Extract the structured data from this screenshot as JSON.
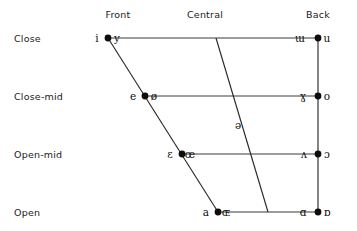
{
  "figure": {
    "background": "#ffffff",
    "ink": "#1a1a1a"
  },
  "columns": [
    {
      "key": "front",
      "label": "Front",
      "x": 118
    },
    {
      "key": "central",
      "label": "Central",
      "x": 205
    },
    {
      "key": "back",
      "label": "Back",
      "x": 318
    }
  ],
  "rows": [
    {
      "key": "close",
      "label": "Close",
      "y": 38
    },
    {
      "key": "close-mid",
      "label": "Close-mid",
      "y": 96
    },
    {
      "key": "open-mid",
      "label": "Open-mid",
      "y": 154
    },
    {
      "key": "open",
      "label": "Open",
      "y": 212
    }
  ],
  "edges": {
    "front_diagonal": {
      "x1": 108,
      "y1": 38,
      "x2": 218,
      "y2": 212
    },
    "back_vertical": {
      "x1": 318,
      "y1": 38,
      "x2": 318,
      "y2": 212
    },
    "central_diagonal": {
      "x1": 216,
      "y1": 38,
      "x2": 268,
      "y2": 212
    }
  },
  "horizontals": [
    {
      "row": "close",
      "x1": 108,
      "x2": 318,
      "y": 38
    },
    {
      "row": "close-mid",
      "x1": 145,
      "x2": 318,
      "y": 96
    },
    {
      "row": "open-mid",
      "x1": 182,
      "x2": 318,
      "y": 154
    },
    {
      "row": "open",
      "x1": 218,
      "x2": 318,
      "y": 212
    }
  ],
  "vowels": [
    {
      "row": "close",
      "column": "front",
      "dot": {
        "cx": 108,
        "cy": 38
      },
      "unrounded": {
        "symbol": "i",
        "name": "close-front-unrounded",
        "x": 97,
        "y": 42
      },
      "rounded": {
        "symbol": "y",
        "name": "close-front-rounded",
        "x": 117,
        "y": 42
      }
    },
    {
      "row": "close",
      "column": "back",
      "dot": {
        "cx": 318,
        "cy": 38
      },
      "unrounded": {
        "symbol": "ɯ",
        "name": "close-back-unrounded",
        "x": 300,
        "y": 42
      },
      "rounded": {
        "symbol": "u",
        "name": "close-back-rounded",
        "x": 327,
        "y": 42
      }
    },
    {
      "row": "close-mid",
      "column": "front",
      "dot": {
        "cx": 145,
        "cy": 96
      },
      "unrounded": {
        "symbol": "e",
        "name": "close-mid-front-unrounded",
        "x": 133,
        "y": 100
      },
      "rounded": {
        "symbol": "ø",
        "name": "close-mid-front-rounded",
        "x": 154,
        "y": 100
      }
    },
    {
      "row": "close-mid",
      "column": "back",
      "dot": {
        "cx": 318,
        "cy": 96
      },
      "unrounded": {
        "symbol": "ɣ",
        "name": "close-mid-back-unrounded",
        "x": 303,
        "y": 100
      },
      "rounded": {
        "symbol": "o",
        "name": "close-mid-back-rounded",
        "x": 327,
        "y": 100
      }
    },
    {
      "row": "open-mid",
      "column": "front",
      "dot": {
        "cx": 182,
        "cy": 154
      },
      "unrounded": {
        "symbol": "ɛ",
        "name": "open-mid-front-unrounded",
        "x": 170,
        "y": 158
      },
      "rounded": {
        "symbol": "œ",
        "name": "open-mid-front-rounded",
        "x": 190,
        "y": 158
      }
    },
    {
      "row": "open-mid",
      "column": "back",
      "dot": {
        "cx": 318,
        "cy": 154
      },
      "unrounded": {
        "symbol": "ʌ",
        "name": "open-mid-back-unrounded",
        "x": 304,
        "y": 158
      },
      "rounded": {
        "symbol": "ɔ",
        "name": "open-mid-back-rounded",
        "x": 327,
        "y": 158
      }
    },
    {
      "row": "open",
      "column": "front",
      "dot": {
        "cx": 218,
        "cy": 212
      },
      "unrounded": {
        "symbol": "a",
        "name": "open-front-unrounded",
        "x": 206,
        "y": 216
      },
      "rounded": {
        "symbol": "ɶ",
        "name": "open-front-rounded",
        "x": 226,
        "y": 216
      }
    },
    {
      "row": "open",
      "column": "back",
      "dot": {
        "cx": 318,
        "cy": 212
      },
      "unrounded": {
        "symbol": "ɑ",
        "name": "open-back-unrounded",
        "x": 303,
        "y": 216
      },
      "rounded": {
        "symbol": "ɒ",
        "name": "open-back-rounded",
        "x": 327,
        "y": 216
      }
    }
  ],
  "central_vowels": [
    {
      "symbol": "ə",
      "name": "mid-central-schwa",
      "x": 238,
      "y": 129
    }
  ],
  "row_label_x": 14,
  "chart_data": {
    "type": "scatter",
    "xlabel": "",
    "ylabel": "",
    "categories": [
      "Front",
      "Central",
      "Back"
    ],
    "tick_labels_y": [
      "Close",
      "Close-mid",
      "Open-mid",
      "Open"
    ],
    "grid": true,
    "legend": "none",
    "points": [
      {
        "symbol": "i",
        "height": "Close",
        "backness": "Front",
        "rounding": "unrounded"
      },
      {
        "symbol": "y",
        "height": "Close",
        "backness": "Front",
        "rounding": "rounded"
      },
      {
        "symbol": "ɯ",
        "height": "Close",
        "backness": "Back",
        "rounding": "unrounded"
      },
      {
        "symbol": "u",
        "height": "Close",
        "backness": "Back",
        "rounding": "rounded"
      },
      {
        "symbol": "e",
        "height": "Close-mid",
        "backness": "Front",
        "rounding": "unrounded"
      },
      {
        "symbol": "ø",
        "height": "Close-mid",
        "backness": "Front",
        "rounding": "rounded"
      },
      {
        "symbol": "ɣ",
        "height": "Close-mid",
        "backness": "Back",
        "rounding": "unrounded"
      },
      {
        "symbol": "o",
        "height": "Close-mid",
        "backness": "Back",
        "rounding": "rounded"
      },
      {
        "symbol": "ə",
        "height": "Mid",
        "backness": "Central",
        "rounding": "unspecified"
      },
      {
        "symbol": "ɛ",
        "height": "Open-mid",
        "backness": "Front",
        "rounding": "unrounded"
      },
      {
        "symbol": "œ",
        "height": "Open-mid",
        "backness": "Front",
        "rounding": "rounded"
      },
      {
        "symbol": "ʌ",
        "height": "Open-mid",
        "backness": "Back",
        "rounding": "unrounded"
      },
      {
        "symbol": "ɔ",
        "height": "Open-mid",
        "backness": "Back",
        "rounding": "rounded"
      },
      {
        "symbol": "a",
        "height": "Open",
        "backness": "Front",
        "rounding": "unrounded"
      },
      {
        "symbol": "ɶ",
        "height": "Open",
        "backness": "Front",
        "rounding": "rounded"
      },
      {
        "symbol": "ɑ",
        "height": "Open",
        "backness": "Back",
        "rounding": "unrounded"
      },
      {
        "symbol": "ɒ",
        "height": "Open",
        "backness": "Back",
        "rounding": "rounded"
      }
    ]
  }
}
